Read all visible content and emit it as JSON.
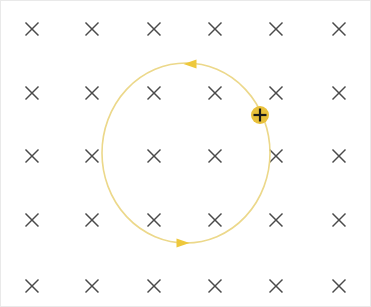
{
  "figure": {
    "width": 371,
    "height": 307,
    "background_color": "#ffffff",
    "border_color": "#e9e9e9"
  },
  "chart_data": {
    "type": "scatter",
    "xlabel": "",
    "ylabel": "",
    "xlim": [
      0,
      371
    ],
    "ylim": [
      0,
      307
    ],
    "grid": false,
    "legend": null,
    "annotations": [
      "Magnetic field B directed into the page (× symbols)",
      "Circular orbit traversed counterclockwise",
      "Positive charge on orbit at right side"
    ],
    "series": [
      {
        "name": "magnetic-field-into-page",
        "marker": "×",
        "color": "#4a4a4a",
        "x": [
          31,
          91,
          153,
          214,
          275,
          338,
          31,
          91,
          153,
          214,
          275,
          338,
          31,
          91,
          153,
          214,
          275,
          338,
          31,
          91,
          153,
          214,
          275,
          338,
          31,
          91,
          153,
          214,
          275,
          338
        ],
        "y": [
          28,
          28,
          28,
          28,
          28,
          28,
          92,
          92,
          92,
          92,
          92,
          92,
          155,
          155,
          155,
          155,
          155,
          155,
          219,
          219,
          219,
          219,
          219,
          219,
          285,
          285,
          285,
          285,
          285,
          285
        ]
      },
      {
        "name": "circular-orbit",
        "type": "ellipse",
        "color": "#ecd88a",
        "center_x": 185,
        "center_y": 152,
        "radius_x": 84,
        "radius_y": 90,
        "stroke_width": 1.6,
        "direction": "counterclockwise"
      },
      {
        "name": "positive-charge",
        "marker": "filled-circle-with-plus",
        "fill_color": "#e8c03a",
        "sign_color": "#1a1a1a",
        "x": 259,
        "y": 114,
        "radius": 9
      }
    ],
    "arrowheads": [
      {
        "name": "top-arrowhead",
        "x": 189,
        "y": 63,
        "direction": "left",
        "color": "#eec83c"
      },
      {
        "name": "bottom-arrowhead",
        "x": 182,
        "y": 242,
        "direction": "right",
        "color": "#eec83c"
      }
    ]
  },
  "field": {
    "symbol": "×",
    "label": "field-into-page",
    "color": "#4a4a4a",
    "columns_x": [
      31,
      91,
      153,
      214,
      275,
      338
    ],
    "rows_y": [
      28,
      92,
      155,
      219,
      285
    ],
    "size": 13,
    "stroke_width": 1.5
  },
  "orbit": {
    "label": "circular-trajectory",
    "color": "#ecd88a",
    "center_x": 185,
    "center_y": 152,
    "radius_x": 84,
    "radius_y": 90,
    "stroke_width": 1.6
  },
  "arrows": {
    "color": "#eec83c",
    "top": {
      "x": 189,
      "y": 63,
      "points": "left"
    },
    "bottom": {
      "x": 182,
      "y": 242,
      "points": "right"
    }
  },
  "charge": {
    "label": "positive-charge",
    "sign": "+",
    "fill_color": "#e8c03a",
    "sign_color": "#1a1a1a",
    "x": 259,
    "y": 114,
    "radius": 9
  }
}
